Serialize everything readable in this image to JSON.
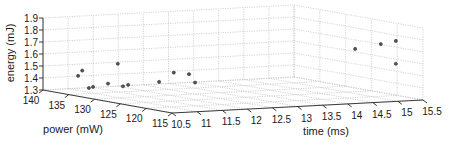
{
  "chart_data": {
    "type": "scatter",
    "projection": "3d",
    "title": "",
    "xlabel": "power (mW)",
    "ylabel": "time (ms)",
    "zlabel": "energy (mJ)",
    "xlim": [
      115,
      140
    ],
    "ylim": [
      10.5,
      15.5
    ],
    "zlim": [
      1.3,
      1.9
    ],
    "xticks": [
      "140",
      "135",
      "130",
      "125",
      "120",
      "115"
    ],
    "xtick_values": [
      140,
      135,
      130,
      125,
      120,
      115
    ],
    "yticks": [
      "10.5",
      "11",
      "11.5",
      "12",
      "12.5",
      "13",
      "13.5",
      "14",
      "14.5",
      "15",
      "15.5"
    ],
    "ytick_values": [
      10.5,
      11,
      11.5,
      12,
      12.5,
      13,
      13.5,
      14,
      14.5,
      15,
      15.5
    ],
    "zticks": [
      "1.3",
      "1.4",
      "1.5",
      "1.6",
      "1.7",
      "1.8",
      "1.9"
    ],
    "ztick_values": [
      1.3,
      1.4,
      1.5,
      1.6,
      1.7,
      1.8,
      1.9
    ],
    "grid": true,
    "marker_color": "#555555",
    "points": [
      {
        "power": 133.2,
        "time": 10.5,
        "energy": 1.47
      },
      {
        "power": 132.4,
        "time": 10.5,
        "energy": 1.52
      },
      {
        "power": 131.1,
        "time": 10.5,
        "energy": 1.385
      },
      {
        "power": 130.3,
        "time": 10.5,
        "energy": 1.4
      },
      {
        "power": 127.4,
        "time": 10.5,
        "energy": 1.45
      },
      {
        "power": 125.5,
        "time": 10.5,
        "energy": 1.63
      },
      {
        "power": 124.5,
        "time": 10.5,
        "energy": 1.45
      },
      {
        "power": 123.5,
        "time": 10.5,
        "energy": 1.47
      },
      {
        "power": 117.5,
        "time": 10.5,
        "energy": 1.54
      },
      {
        "power": 116.6,
        "time": 10.7,
        "energy": 1.62
      },
      {
        "power": 115.6,
        "time": 10.9,
        "energy": 1.61
      },
      {
        "power": 115.4,
        "time": 11.0,
        "energy": 1.54
      },
      {
        "power": 115.5,
        "time": 14.2,
        "energy": 1.75
      },
      {
        "power": 115.4,
        "time": 14.7,
        "energy": 1.78
      },
      {
        "power": 115.4,
        "time": 15.0,
        "energy": 1.8
      },
      {
        "power": 115.4,
        "time": 15.0,
        "energy": 1.61
      }
    ]
  }
}
